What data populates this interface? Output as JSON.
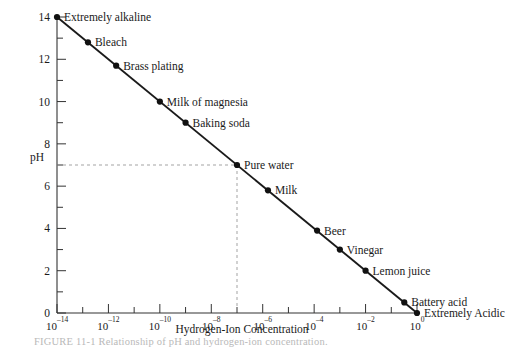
{
  "figure": {
    "caption": "FIGURE 11-1   Relationship of pH and hydrogen-ion concentration.",
    "background_color": "#ffffff",
    "line_color": "#1a1a1a",
    "guide_color": "#999999"
  },
  "chart_data": {
    "type": "line",
    "title": "",
    "xlabel": "Hydrogen-Ion Concentration",
    "ylabel": "pH",
    "xscale": "log",
    "xlim": [
      1e-14,
      1
    ],
    "ylim": [
      0,
      14
    ],
    "grid": false,
    "legend": null,
    "x_tick_labels": [
      {
        "base": "10",
        "exp": "–14",
        "value": 1e-14
      },
      {
        "base": "10",
        "exp": "–12",
        "value": 1e-12
      },
      {
        "base": "10",
        "exp": "–10",
        "value": 1e-10
      },
      {
        "base": "10",
        "exp": "–8",
        "value": 1e-08
      },
      {
        "base": "10",
        "exp": "–6",
        "value": 1e-06
      },
      {
        "base": "10",
        "exp": "–4",
        "value": 0.0001
      },
      {
        "base": "10",
        "exp": "–2",
        "value": 0.01
      },
      {
        "base": "10",
        "exp": "0",
        "value": 1
      }
    ],
    "y_tick_labels": [
      "0",
      "2",
      "4",
      "6",
      "8",
      "10",
      "12",
      "14"
    ],
    "y_major_ticks": [
      0,
      2,
      4,
      6,
      8,
      10,
      12,
      14
    ],
    "y_minor_ticks": [
      1,
      3,
      5,
      7,
      9,
      11,
      13
    ],
    "series": [
      {
        "name": "pH vs hydrogen-ion concentration",
        "x": [
          1e-14,
          1
        ],
        "y": [
          14,
          0
        ]
      }
    ],
    "points": [
      {
        "label": "Extremely alkaline",
        "ph": 14,
        "concentration": 1e-14
      },
      {
        "label": "Bleach",
        "ph": 12.8,
        "concentration": 1.6e-13
      },
      {
        "label": "Brass plating",
        "ph": 11.7,
        "concentration": 2e-12
      },
      {
        "label": "Milk of magnesia",
        "ph": 10,
        "concentration": 1e-10
      },
      {
        "label": "Baking soda",
        "ph": 9,
        "concentration": 1e-09
      },
      {
        "label": "Pure water",
        "ph": 7,
        "concentration": 1e-07
      },
      {
        "label": "Milk",
        "ph": 5.8,
        "concentration": 1.6e-06
      },
      {
        "label": "Beer",
        "ph": 3.9,
        "concentration": 0.00013
      },
      {
        "label": "Vinegar",
        "ph": 3,
        "concentration": 0.001
      },
      {
        "label": "Lemon juice",
        "ph": 2,
        "concentration": 0.01
      },
      {
        "label": "Battery acid",
        "ph": 0.5,
        "concentration": 0.32
      },
      {
        "label": "Extremely Acidic",
        "ph": 0,
        "concentration": 1
      }
    ],
    "annotations": [
      {
        "name": "pure-water-guide",
        "type": "dashed-crosshair",
        "ph": 7,
        "concentration": 1e-07
      }
    ]
  }
}
